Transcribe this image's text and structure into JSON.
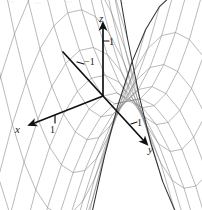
{
  "figure": {
    "kind": "3d-surface-plot",
    "surface_name": "hyperbolic-paraboloid-saddle",
    "background_color": "#ffffff",
    "mesh_color": "#808080",
    "edge_color": "#333333",
    "axis_color": "#111111"
  },
  "axes": {
    "z": {
      "label": "z",
      "tick_label": "1",
      "direction": "up"
    },
    "x": {
      "label": "x",
      "tick_label": "1",
      "direction": "down-left"
    },
    "y": {
      "label": "y",
      "tick_label": "1",
      "neg_tick_label": "−1",
      "direction": "down-right"
    }
  },
  "chart_data": {
    "type": "surface",
    "title": "",
    "equation": "z = y^2 - x^2",
    "xlabel": "x",
    "ylabel": "y",
    "zlabel": "z",
    "xlim": [
      -1.6,
      1.6
    ],
    "ylim": [
      -1.6,
      1.6
    ],
    "zlim": [
      -2.5,
      2.5
    ],
    "ticks": {
      "x": [
        1
      ],
      "y": [
        -1,
        1
      ],
      "z": [
        1
      ]
    },
    "grid": true,
    "legend": false,
    "mesh_steps": {
      "u": 13,
      "v": 13
    },
    "projection": {
      "origin_px": [
        103,
        96
      ],
      "x_axis_px": [
        -52,
        30
      ],
      "y_axis_px": [
        44,
        48
      ],
      "z_axis_px": [
        0,
        -70
      ]
    }
  }
}
